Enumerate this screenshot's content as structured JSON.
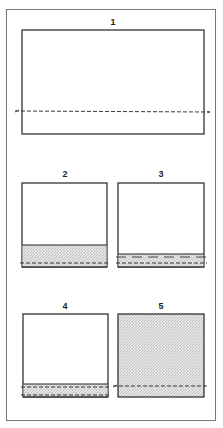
{
  "figure": {
    "panels": [
      {
        "id": "1",
        "label": "1",
        "fill_level": "none",
        "description": "Empty frame with single dashed reference line"
      },
      {
        "id": "2",
        "label": "2",
        "fill_level": "low",
        "description": "Shaded band at bottom, dashed line near bottom"
      },
      {
        "id": "3",
        "label": "3",
        "fill_level": "very-low",
        "description": "Thin shaded band with two dashed lines"
      },
      {
        "id": "4",
        "label": "4",
        "fill_level": "very-low",
        "description": "Thin shaded band between two dashed lines"
      },
      {
        "id": "5",
        "label": "5",
        "fill_level": "full",
        "description": "Fully shaded frame with dashed line"
      }
    ],
    "colors": {
      "stroke": "#222222",
      "frame": "#777777",
      "shade": "#d9d9d9"
    }
  }
}
